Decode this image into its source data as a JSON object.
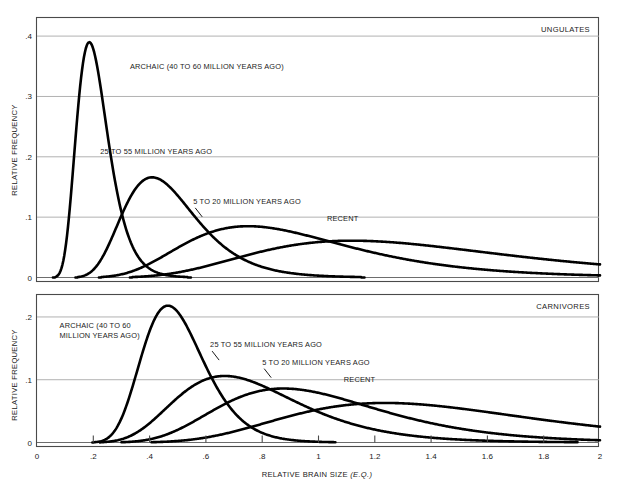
{
  "figure": {
    "width": 617,
    "height": 484,
    "background": "#ffffff",
    "curve_color": "#000000",
    "grid_color": "#a8a8a8",
    "frame_color": "#4a4a4a"
  },
  "axis": {
    "x_title_main": "RELATIVE BRAIN SIZE ",
    "x_title_italic": "(E.Q.)",
    "y_title": "RELATIVE FREQUENCY",
    "x_ticks": [
      "0",
      ".2",
      ".4",
      ".6",
      ".8",
      "1",
      "1.2",
      "1.4",
      "1.6",
      "1.8",
      "2"
    ],
    "x_tick_values": [
      0,
      0.2,
      0.4,
      0.6,
      0.8,
      1.0,
      1.2,
      1.4,
      1.6,
      1.8,
      2.0
    ],
    "xlim": [
      0,
      2
    ]
  },
  "chart_data": [
    {
      "type": "line",
      "panel": "top",
      "title": "UNGULATES",
      "xlabel": "RELATIVE BRAIN SIZE (E.Q.)",
      "ylabel": "RELATIVE FREQUENCY",
      "xlim": [
        0,
        2
      ],
      "ylim": [
        0,
        0.43
      ],
      "grid": true,
      "y_ticks": [
        "0",
        ".1",
        ".2",
        ".3",
        ".4"
      ],
      "y_tick_values": [
        0,
        0.1,
        0.2,
        0.3,
        0.4
      ],
      "legend_position": "inline-annotations",
      "series": [
        {
          "name": "ARCHAIC (40 TO 60 MILLION YEARS AGO)",
          "label": "ARCHAIC (40 TO 60 MILLION YEARS AGO)",
          "distribution": "lognormal",
          "peak_x": 0.17,
          "peak_y": 0.39,
          "spread": 0.052,
          "label_x": 0.33,
          "label_y": 0.345,
          "leader": false
        },
        {
          "name": "25 TO 55 MILLION YEARS AGO",
          "label": "25 TO 55 MILLION YEARS AGO",
          "distribution": "lognormal",
          "peak_x": 0.37,
          "peak_y": 0.166,
          "spread": 0.12,
          "label_x": 0.225,
          "label_y": 0.205,
          "leader": false
        },
        {
          "name": "5 TO 20 MILLION YEARS AGO",
          "label": "5 TO 20 MILLION YEARS AGO",
          "distribution": "lognormal",
          "peak_x": 0.645,
          "peak_y": 0.085,
          "spread": 0.26,
          "label_x": 0.555,
          "label_y": 0.122,
          "leader": true
        },
        {
          "name": "RECENT",
          "label": "RECENT",
          "distribution": "lognormal",
          "peak_x": 0.95,
          "peak_y": 0.061,
          "spread": 0.4,
          "label_x": 1.03,
          "label_y": 0.093,
          "leader": false
        }
      ]
    },
    {
      "type": "line",
      "panel": "bottom",
      "title": "CARNIVORES",
      "xlabel": "RELATIVE BRAIN SIZE (E.Q.)",
      "ylabel": "RELATIVE FREQUENCY",
      "xlim": [
        0,
        2
      ],
      "ylim": [
        0,
        0.235
      ],
      "grid": true,
      "y_ticks": [
        "0",
        ".1",
        ".2"
      ],
      "y_tick_values": [
        0,
        0.1,
        0.2
      ],
      "legend_position": "inline-annotations",
      "series": [
        {
          "name": "ARCHAIC (40 TO 60 MILLION YEARS AGO)",
          "label_line1": "ARCHAIC (40 TO 60",
          "label_line2": "MILLION YEARS AGO)",
          "distribution": "lognormal",
          "peak_x": 0.44,
          "peak_y": 0.218,
          "spread": 0.105,
          "label_x": 0.08,
          "label_y": 0.182,
          "leader": false
        },
        {
          "name": "25 TO 55 MILLION YEARS AGO",
          "label": "25 TO 55 MILLION YEARS AGO",
          "distribution": "lognormal",
          "peak_x": 0.6,
          "peak_y": 0.106,
          "spread": 0.2,
          "label_x": 0.615,
          "label_y": 0.152,
          "leader": true
        },
        {
          "name": "5 TO 20 MILLION YEARS AGO",
          "label": "5 TO 20 MILLION YEARS AGO",
          "distribution": "lognormal",
          "peak_x": 0.785,
          "peak_y": 0.086,
          "spread": 0.265,
          "label_x": 0.8,
          "label_y": 0.124,
          "leader": true
        },
        {
          "name": "RECENT",
          "label": "RECENT",
          "distribution": "lognormal",
          "peak_x": 1.09,
          "peak_y": 0.063,
          "spread": 0.4,
          "label_x": 1.09,
          "label_y": 0.097,
          "leader": false
        }
      ]
    }
  ]
}
